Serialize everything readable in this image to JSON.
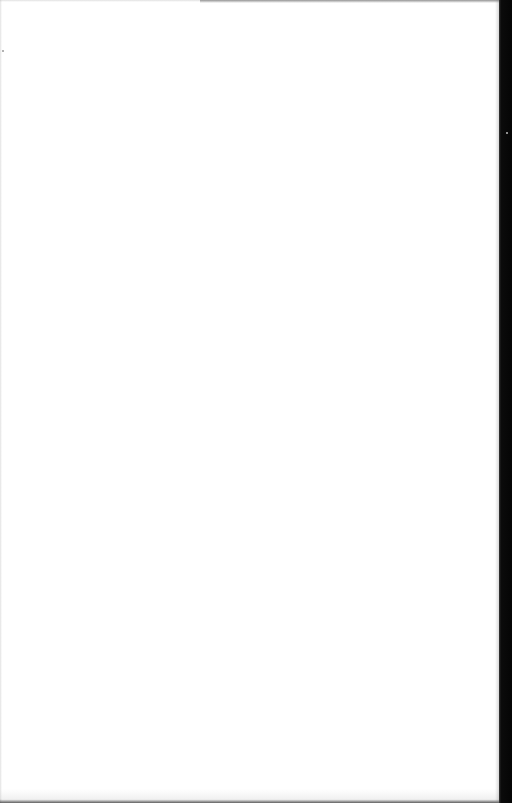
{
  "document": {
    "type": "scanned-page",
    "content": "",
    "is_blank": true,
    "colors": {
      "paper": "#ffffff",
      "scan_edge": "#050505"
    }
  }
}
